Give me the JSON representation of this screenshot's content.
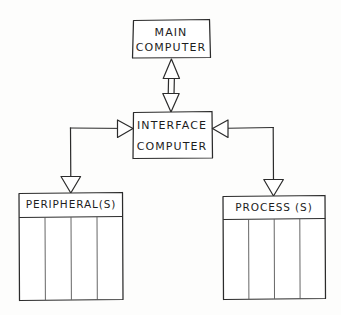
{
  "diagram": {
    "style": "hand-drawn pencil sketch",
    "background_color": "#fdfdfc",
    "ink_color": "#2b2b2b",
    "nodes": [
      {
        "id": "main-computer",
        "line1": "MAIN",
        "line2": "COMPUTER",
        "has_columns": false,
        "column_count": 0
      },
      {
        "id": "interface-computer",
        "line1": "INTERFACE",
        "line2": "COMPUTER",
        "has_columns": false,
        "column_count": 0
      },
      {
        "id": "peripherals",
        "line1": "PERIPHERAL(S)",
        "line2": "",
        "has_columns": true,
        "column_count": 4
      },
      {
        "id": "processes",
        "line1": "PROCESS (S)",
        "line2": "",
        "has_columns": true,
        "column_count": 4
      }
    ],
    "connectors": [
      {
        "id": "main-to-interface",
        "from": "main-computer",
        "to": "interface-computer",
        "direction": "bidirectional",
        "arrow_style": "open-triangle"
      },
      {
        "id": "interface-to-peripherals",
        "from": "interface-computer",
        "to": "peripherals",
        "direction": "both-ends",
        "arrow_style": "open-triangle"
      },
      {
        "id": "interface-to-processes",
        "from": "interface-computer",
        "to": "processes",
        "direction": "both-ends",
        "arrow_style": "open-triangle"
      }
    ]
  }
}
